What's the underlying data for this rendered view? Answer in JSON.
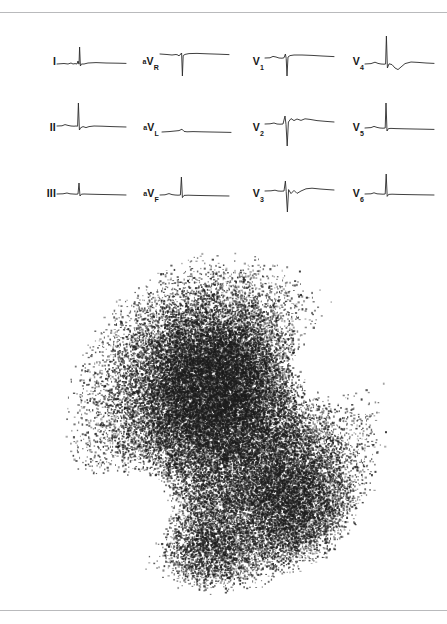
{
  "figure": {
    "top_rule": true,
    "bottom_rule": true,
    "background_color": "#ffffff",
    "rule_color": "#b9babc",
    "trace_color": "#2a2a2a"
  },
  "ecg": {
    "description": "12-lead electrocardiogram, four columns of three leads",
    "columns": 4,
    "rows": 3,
    "leads": [
      {
        "id": "I",
        "label_prefix": "",
        "label_main": "I",
        "label_sub": "",
        "row": 0,
        "column": 0,
        "morphology": "small upright R wave with flat baseline, low-amplitude T wave"
      },
      {
        "id": "aVR",
        "label_prefix": "a",
        "label_main": "V",
        "label_sub": "R",
        "row": 0,
        "column": 1,
        "morphology": "deep negative QS complex, inverted P and T"
      },
      {
        "id": "V1",
        "label_prefix": "",
        "label_main": "V",
        "label_sub": "1",
        "row": 0,
        "column": 2,
        "morphology": "small r wave with deep S wave, rS pattern"
      },
      {
        "id": "V4",
        "label_prefix": "",
        "label_main": "V",
        "label_sub": "4",
        "row": 0,
        "column": 3,
        "morphology": "tall R wave, shallow S, biphasic T wave"
      },
      {
        "id": "II",
        "label_prefix": "",
        "label_main": "II",
        "label_sub": "",
        "row": 1,
        "column": 0,
        "morphology": "upright R wave, small s wave, flat T wave"
      },
      {
        "id": "aVL",
        "label_prefix": "a",
        "label_main": "V",
        "label_sub": "L",
        "row": 1,
        "column": 1,
        "morphology": "nearly isoelectric, very low amplitude complex"
      },
      {
        "id": "V2",
        "label_prefix": "",
        "label_main": "V",
        "label_sub": "2",
        "row": 1,
        "column": 2,
        "morphology": "deep S wave with prominent upright T wave"
      },
      {
        "id": "V5",
        "label_prefix": "",
        "label_main": "V",
        "label_sub": "5",
        "row": 1,
        "column": 3,
        "morphology": "tall narrow R wave, flat ST segment"
      },
      {
        "id": "III",
        "label_prefix": "",
        "label_main": "III",
        "label_sub": "",
        "row": 2,
        "column": 0,
        "morphology": "low-amplitude R wave, flat baseline"
      },
      {
        "id": "aVF",
        "label_prefix": "a",
        "label_main": "V",
        "label_sub": "F",
        "row": 2,
        "column": 1,
        "morphology": "modest upright R wave, flat T wave"
      },
      {
        "id": "V3",
        "label_prefix": "",
        "label_main": "V",
        "label_sub": "3",
        "row": 2,
        "column": 2,
        "morphology": "deep S wave with upright rounded T wave"
      },
      {
        "id": "V6",
        "label_prefix": "",
        "label_main": "V",
        "label_sub": "6",
        "row": 2,
        "column": 3,
        "morphology": "upright R wave, small s wave, flat baseline"
      }
    ]
  },
  "scintigram": {
    "description": "Radionuclide dot scintigram showing a roughly circular field of counts with a dense central focus and a second dense region at lower right",
    "field_shape": "circle",
    "dot_color": "#1d1d1d",
    "hot_spots": [
      {
        "name": "central-focus",
        "cx": 0.46,
        "cy": 0.38,
        "radius": 0.19,
        "intensity": 1.0
      },
      {
        "name": "lower-right-focus",
        "cx": 0.71,
        "cy": 0.74,
        "radius": 0.15,
        "intensity": 0.85
      },
      {
        "name": "inferior-focus",
        "cx": 0.45,
        "cy": 0.87,
        "radius": 0.12,
        "intensity": 0.6
      }
    ],
    "cold_spots": [
      {
        "name": "right-upper-defect",
        "cx": 0.74,
        "cy": 0.36,
        "radius": 0.14
      },
      {
        "name": "left-lower-defect",
        "cx": 0.27,
        "cy": 0.72,
        "radius": 0.13
      }
    ]
  }
}
